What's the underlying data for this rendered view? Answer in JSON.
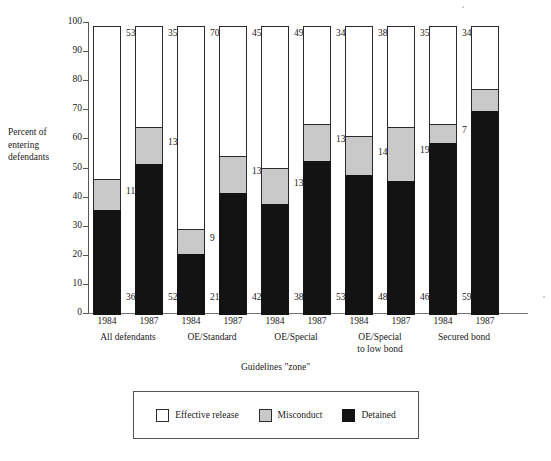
{
  "chart_data": {
    "type": "bar",
    "subtype": "stacked-bar",
    "title": "",
    "xlabel": "Guidelines \"zone\"",
    "ylabel": "Percent of entering defendants",
    "ylim": [
      0,
      100
    ],
    "ytick_step": 10,
    "ytick_labels": [
      "100",
      "90",
      "80",
      "70",
      "60",
      "50",
      "40",
      "30",
      "20",
      "10",
      "0"
    ],
    "grid": false,
    "legend_position": "bottom",
    "stack_order_bottom_to_top": [
      "Detained",
      "Misconduct",
      "Effective release"
    ],
    "series": [
      {
        "name": "Detained",
        "color": "#131313",
        "values": [
          36,
          52,
          21,
          42,
          38,
          53,
          48,
          46,
          59,
          70
        ]
      },
      {
        "name": "Misconduct",
        "color": "#c9c9c9",
        "values": [
          11,
          13,
          9,
          13,
          13,
          13,
          14,
          19,
          7,
          8
        ]
      },
      {
        "name": "Effective release",
        "color": "#ffffff",
        "values": [
          53,
          35,
          70,
          45,
          49,
          34,
          38,
          35,
          34,
          22
        ]
      }
    ],
    "categories": [
      "1984",
      "1987",
      "1984",
      "1987",
      "1984",
      "1987",
      "1984",
      "1987",
      "1984",
      "1987"
    ],
    "groups": [
      {
        "label": "All defendants",
        "label_line2": "",
        "years": [
          "1984",
          "1987"
        ]
      },
      {
        "label": "OE/Standard",
        "label_line2": "",
        "years": [
          "1984",
          "1987"
        ]
      },
      {
        "label": "OE/Special",
        "label_line2": "",
        "years": [
          "1984",
          "1987"
        ]
      },
      {
        "label": "OE/Special",
        "label_line2": "to low bond",
        "years": [
          "1984",
          "1987"
        ]
      },
      {
        "label": "Secured bond",
        "label_line2": "",
        "years": [
          "1984",
          "1987"
        ]
      }
    ],
    "bars": [
      {
        "group": "All defendants",
        "year": "1984",
        "detained": 36,
        "misconduct": 11,
        "release": 53,
        "labels": {
          "detained": "36",
          "misconduct": "11",
          "release": "53"
        }
      },
      {
        "group": "All defendants",
        "year": "1987",
        "detained": 52,
        "misconduct": 13,
        "release": 35,
        "labels": {
          "detained": "52",
          "misconduct": "13",
          "release": "35"
        }
      },
      {
        "group": "OE/Standard",
        "year": "1984",
        "detained": 21,
        "misconduct": 9,
        "release": 70,
        "labels": {
          "detained": "21",
          "misconduct": "9",
          "release": "70"
        }
      },
      {
        "group": "OE/Standard",
        "year": "1987",
        "detained": 42,
        "misconduct": 13,
        "release": 45,
        "labels": {
          "detained": "42",
          "misconduct": "13",
          "release": "45"
        }
      },
      {
        "group": "OE/Special",
        "year": "1984",
        "detained": 38,
        "misconduct": 13,
        "release": 49,
        "labels": {
          "detained": "38",
          "misconduct": "13",
          "release": "49"
        }
      },
      {
        "group": "OE/Special",
        "year": "1987",
        "detained": 53,
        "misconduct": 13,
        "release": 34,
        "labels": {
          "detained": "53",
          "misconduct": "13",
          "release": "34"
        }
      },
      {
        "group": "OE/Special to low bond",
        "year": "1984",
        "detained": 48,
        "misconduct": 14,
        "release": 38,
        "labels": {
          "detained": "48",
          "misconduct": "14",
          "release": "38"
        }
      },
      {
        "group": "OE/Special to low bond",
        "year": "1987",
        "detained": 46,
        "misconduct": 19,
        "release": 35,
        "labels": {
          "detained": "46",
          "misconduct": "19",
          "release": "35"
        }
      },
      {
        "group": "Secured bond",
        "year": "1984",
        "detained": 59,
        "misconduct": 7,
        "release": 34,
        "labels": {
          "detained": "59",
          "misconduct": "7",
          "release": "34"
        }
      },
      {
        "group": "Secured bond",
        "year": "1987",
        "detained": 70,
        "misconduct": 8,
        "release": 22,
        "labels": {
          "detained": "",
          "misconduct": "",
          "release": ""
        }
      }
    ],
    "legend": [
      {
        "label": "Effective release",
        "swatch": "release"
      },
      {
        "label": "Misconduct",
        "swatch": "misconduct"
      },
      {
        "label": "Detained",
        "swatch": "detained"
      }
    ]
  },
  "axis": {
    "y_title_line1": "Percent of",
    "y_title_line2": "entering",
    "y_title_line3": "defendants",
    "x_title": "Guidelines \"zone\""
  },
  "colors": {
    "detained": "#131313",
    "misconduct": "#c9c9c9",
    "release": "#ffffff",
    "axis": "#555555",
    "text": "#1a1a1a"
  }
}
